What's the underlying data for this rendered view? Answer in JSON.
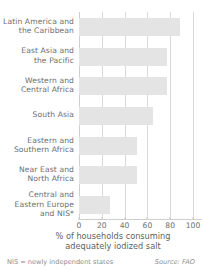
{
  "chart_data": {
    "type": "bar",
    "orientation": "horizontal",
    "title": "",
    "xlabel": "% of households consuming adequately iodized salt",
    "ylabel": "",
    "xlim": [
      0,
      100
    ],
    "xticks": [
      0,
      20,
      40,
      60,
      80,
      100
    ],
    "grid": true,
    "legend": null,
    "categories": [
      "Latin America and the Caribbean",
      "East Asia and the Pacific",
      "Western and Central Africa",
      "South Asia",
      "Eastern and Southern Africa",
      "Near East and North Africa",
      "Central and Eastern Europe and NIS*"
    ],
    "values": [
      89,
      77,
      77,
      65,
      51,
      51,
      27
    ],
    "bar_color": "#e4e4e4"
  },
  "axis": {
    "title_line1": "% of households consuming",
    "title_line2": "adequately iodized salt",
    "tick_labels": [
      "0",
      "20",
      "40",
      "60",
      "80",
      "100"
    ]
  },
  "categories": [
    {
      "line1": "Latin America and",
      "line2": "the Caribbean",
      "line3": ""
    },
    {
      "line1": "East Asia and",
      "line2": "the Pacific",
      "line3": ""
    },
    {
      "line1": "Western and",
      "line2": "Central Africa",
      "line3": ""
    },
    {
      "line1": "South Asia",
      "line2": "",
      "line3": ""
    },
    {
      "line1": "Eastern and",
      "line2": "Southern Africa",
      "line3": ""
    },
    {
      "line1": "Near East and",
      "line2": "North Africa",
      "line3": ""
    },
    {
      "line1": "Central and",
      "line2": "Eastern Europe",
      "line3": "and NIS*"
    }
  ],
  "footnote": "NIS = newly independent states",
  "source": "Source: FAO",
  "colors": {
    "bar": "#e4e4e4",
    "grid": "#d9d9d9",
    "text": "#6e6e6e",
    "muted": "#8d8d8d",
    "background": "#ffffff"
  }
}
